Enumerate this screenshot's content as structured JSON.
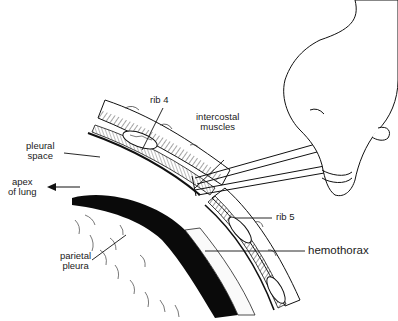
{
  "figure": {
    "colors": {
      "ink": "#111111",
      "background": "#ffffff",
      "hemothorax_fill": "#0a0a0a"
    }
  },
  "labels": {
    "rib4": "rib 4",
    "intercostal_1": "intercostal",
    "intercostal_2": "muscles",
    "pleural_1": "pleural",
    "pleural_2": "space",
    "apex_1": "apex",
    "apex_2": "of lung",
    "rib5": "rib 5",
    "hemothorax": "hemothorax",
    "parietal_1": "parietal",
    "parietal_2": "pleura"
  }
}
